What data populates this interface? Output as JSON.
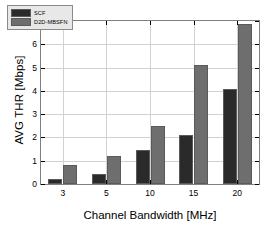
{
  "chart_data": {
    "type": "bar",
    "title": "",
    "xlabel": "Channel Bandwidth  [MHz]",
    "ylabel": "AVG THR [Mbps]",
    "categories": [
      "3",
      "5",
      "10",
      "15",
      "20"
    ],
    "xtick_labels": [
      "3",
      "5",
      "10",
      "15",
      "20"
    ],
    "ytick_labels": [
      "0",
      "1",
      "2",
      "3",
      "4",
      "5",
      "6",
      "7"
    ],
    "ylim": [
      0,
      7
    ],
    "ytick_values": [
      0,
      1,
      2,
      3,
      4,
      5,
      6,
      7
    ],
    "grid": true,
    "legend_position": "upper-left",
    "series": [
      {
        "name": "SCF",
        "color": "#2a2a2a",
        "values": [
          0.22,
          0.45,
          1.47,
          2.12,
          4.07
        ]
      },
      {
        "name": "D2D-MBSFN",
        "color": "#6e6e6e",
        "values": [
          0.81,
          1.22,
          2.48,
          5.13,
          6.88
        ]
      }
    ]
  },
  "legend": {
    "items": [
      {
        "label": "SCF",
        "color": "#2a2a2a"
      },
      {
        "label": "D2D-MBSFN",
        "color": "#6e6e6e"
      }
    ]
  },
  "axes": {
    "y_title": "AVG THR [Mbps]",
    "x_title": "Channel Bandwidth  [MHz]"
  }
}
